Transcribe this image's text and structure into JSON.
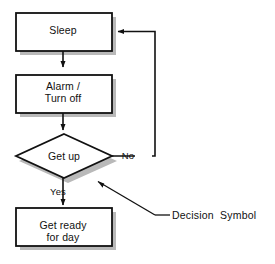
{
  "diagram": {
    "colors": {
      "stroke": "#111111",
      "fill": "#ffffff",
      "shadow": "#b8b8b8",
      "background": "#ffffff"
    },
    "nodes": [
      {
        "id": "sleep",
        "type": "process",
        "label": "Sleep"
      },
      {
        "id": "alarm",
        "type": "process",
        "label": "Alarm /\nTurn off"
      },
      {
        "id": "getup",
        "type": "decision",
        "label": "Get up"
      },
      {
        "id": "getready",
        "type": "process",
        "label": "Get ready\nfor day"
      }
    ],
    "edges": [
      {
        "id": "sleep-to-alarm",
        "from": "sleep",
        "to": "alarm",
        "label": ""
      },
      {
        "id": "alarm-to-getup",
        "from": "alarm",
        "to": "getup",
        "label": ""
      },
      {
        "id": "getup-no-to-sleep",
        "from": "getup",
        "to": "sleep",
        "label": "No"
      },
      {
        "id": "getup-yes-to-getready",
        "from": "getup",
        "to": "getready",
        "label": "Yes"
      }
    ],
    "annotations": [
      {
        "id": "decision-symbol",
        "text": "Decision  Symbol",
        "points_to": "getup"
      }
    ]
  }
}
